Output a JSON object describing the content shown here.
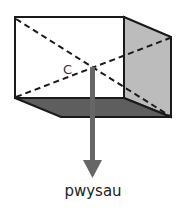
{
  "diagram": {
    "center_label": "C",
    "force_label": "pwysau",
    "colors": {
      "outline": "#1a1a1a",
      "side_face": "#bcbcbc",
      "bottom_face": "#5e5e5e",
      "arrow": "#666666"
    }
  }
}
